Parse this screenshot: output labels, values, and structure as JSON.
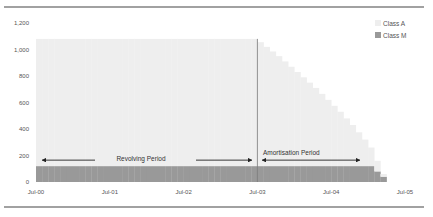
{
  "chart_data": {
    "type": "bar",
    "stacked": true,
    "title": "",
    "xlabel": "",
    "ylabel": "",
    "ylim": [
      0,
      1200
    ],
    "yticks": [
      "0",
      "200",
      "400",
      "600",
      "800",
      "1,000",
      "1,200"
    ],
    "ytick_values": [
      0,
      200,
      400,
      600,
      800,
      1000,
      1200
    ],
    "xtick_labels": [
      "Jul-00",
      "Jul-01",
      "Jul-02",
      "Jul-03",
      "Jul-04",
      "Jul-05"
    ],
    "x_start": "Jul-00",
    "x_end": "Jul-05",
    "months_total": 60,
    "grid": false,
    "legend_position": "top-right",
    "legend": [
      {
        "name": "Class A",
        "color": "#eeeeee"
      },
      {
        "name": "Class M",
        "color": "#999999"
      }
    ],
    "series": [
      {
        "name": "Class M",
        "color": "#999999",
        "values": [
          120,
          120,
          120,
          120,
          120,
          120,
          120,
          120,
          120,
          120,
          120,
          120,
          120,
          120,
          120,
          120,
          120,
          120,
          120,
          120,
          120,
          120,
          120,
          120,
          120,
          120,
          120,
          120,
          120,
          120,
          120,
          120,
          120,
          120,
          120,
          120,
          120,
          120,
          120,
          120,
          120,
          120,
          120,
          120,
          120,
          120,
          120,
          120,
          120,
          120,
          120,
          120,
          120,
          120,
          120,
          80,
          40,
          0,
          0,
          0
        ]
      },
      {
        "name": "Class A",
        "color": "#eeeeee",
        "values": [
          960,
          960,
          960,
          960,
          960,
          960,
          960,
          960,
          960,
          960,
          960,
          960,
          960,
          960,
          960,
          960,
          960,
          960,
          960,
          960,
          960,
          960,
          960,
          960,
          960,
          960,
          960,
          960,
          960,
          960,
          960,
          960,
          960,
          960,
          960,
          960,
          935,
          900,
          865,
          830,
          790,
          750,
          710,
          670,
          630,
          590,
          545,
          500,
          455,
          410,
          360,
          310,
          255,
          200,
          140,
          80,
          20,
          0,
          0,
          0
        ]
      }
    ],
    "annotations": [
      {
        "text": "Revolving Period",
        "from": "Jul-00",
        "to": "Jul-03",
        "y": 165
      },
      {
        "text": "Amortisation Period",
        "from": "Jul-03",
        "to": "Jun-04",
        "y": 165
      }
    ],
    "divider_at": "Jul-03"
  }
}
